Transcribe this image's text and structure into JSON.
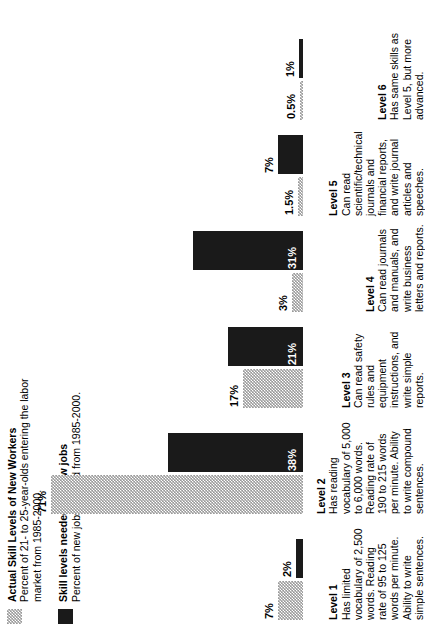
{
  "legend": [
    {
      "swatch": "gray-stipple",
      "title": "Actual Skill Levels of New Workers",
      "subtitle": "Percent of 21- to 25-year-olds entering the labor market from 1985-2000."
    },
    {
      "swatch": "black-solid",
      "title": "Skill levels needed for new jobs",
      "subtitle": "Percent of new jobs created from 1985-2000."
    }
  ],
  "levels": [
    {
      "name": "Level 1",
      "description": "Has limited vocabulary of 2,500 words. Reading rate of 95 to 125 words per minute. Ability to write simple sentences.",
      "actual_label": "7%",
      "needed_label": "2%",
      "actual": 7,
      "needed": 2
    },
    {
      "name": "Level 2",
      "description": "Has reading vocabulary of 5,000 to 6,000 words. Reading rate of 190 to 215 words per minute. Ability to write compound sentences.",
      "actual_label": "71%",
      "needed_label": "38%",
      "actual": 71,
      "needed": 38
    },
    {
      "name": "Level 3",
      "description": "Can read safety rules and equipment instructions, and write simple reports.",
      "actual_label": "17%",
      "needed_label": "21%",
      "actual": 17,
      "needed": 21
    },
    {
      "name": "Level 4",
      "description": "Can read journals and manuals, and write business letters and reports.",
      "actual_label": "3%",
      "needed_label": "31%",
      "actual": 3,
      "needed": 31
    },
    {
      "name": "Level 5",
      "description": "Can read scientific/technical journals and financial reports, and write journal articles and speeches.",
      "actual_label": "1.5%",
      "needed_label": "7%",
      "actual": 1.5,
      "needed": 7
    },
    {
      "name": "Level 6",
      "description": "Has same skills as Level 5, but more advanced.",
      "actual_label": "0.5%",
      "needed_label": "1%",
      "actual": 0.5,
      "needed": 1
    }
  ],
  "chart_data": {
    "type": "bar",
    "categories": [
      "Level 1",
      "Level 2",
      "Level 3",
      "Level 4",
      "Level 5",
      "Level 6"
    ],
    "series": [
      {
        "name": "Actual Skill Levels of New Workers",
        "values": [
          7,
          71,
          17,
          3,
          1.5,
          0.5
        ],
        "labels": [
          "7%",
          "71%",
          "17%",
          "3%",
          "1.5%",
          "0.5%"
        ],
        "color": "#9a9a9a",
        "fill": "gray-stipple"
      },
      {
        "name": "Skill levels needed for new jobs",
        "values": [
          2,
          38,
          21,
          31,
          7,
          1
        ],
        "labels": [
          "2%",
          "38%",
          "21%",
          "31%",
          "7%",
          "1%"
        ],
        "color": "#1a1a1a",
        "fill": "solid"
      }
    ],
    "xlabel": "",
    "ylabel": "Percent",
    "ylim": [
      0,
      75
    ],
    "grid": false,
    "legend_position": "top-left",
    "orientation": "rotated-90-ccw"
  },
  "scale": {
    "px_per_percent": 3.55,
    "max_bar_px": 252
  }
}
